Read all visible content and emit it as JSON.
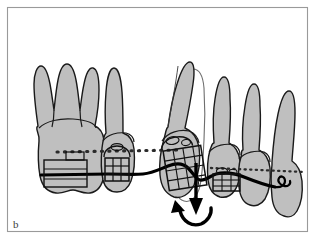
{
  "figure": {
    "panel_label": "b",
    "background_color": "#ffffff",
    "border_color": "#9a9a9a",
    "tooth_fill": "#bfbfbf",
    "tooth_outline": "#1a1a1a",
    "ghost_outline_color": "#6e6e6e",
    "ghost_fill": "#ffffff",
    "archwire_color": "#000000",
    "occlusal_line_color": "#2b2b2b",
    "arrow_color": "#000000",
    "bracket_color": "#111111"
  },
  "teeth": [
    {
      "id": "molar-left",
      "name": "Molar (anchor)",
      "state": "upright",
      "appliance": "molar-tube",
      "crown_center": {
        "x": 70,
        "y": 163
      },
      "roots": 3
    },
    {
      "id": "premolar-left",
      "name": "Second premolar",
      "state": "upright",
      "appliance": "bracket",
      "crown_center": {
        "x": 118,
        "y": 160
      },
      "roots": 1
    },
    {
      "id": "tipped-tooth",
      "name": "Mesially tipped molar / canine",
      "state": "tipped",
      "appliance": "bracket",
      "crown_center": {
        "x": 196,
        "y": 160
      },
      "roots": 1,
      "has_ghost_target": true
    },
    {
      "id": "premolar-right",
      "name": "Premolar",
      "state": "upright",
      "appliance": "bracket",
      "crown_center": {
        "x": 240,
        "y": 168
      },
      "roots": 1
    },
    {
      "id": "canine-right",
      "name": "Canine",
      "state": "upright",
      "appliance": "none",
      "crown_center": {
        "x": 272,
        "y": 175
      },
      "roots": 1
    }
  ],
  "appliances": {
    "archwire": {
      "label": "Sectional archwire",
      "style": "solid-thick",
      "has_step_bend": true,
      "has_distal_hook": true
    },
    "occlusal_plane": {
      "label": "Occlusal reference line",
      "style": "dotted"
    },
    "brackets": [
      {
        "id": "molar-tube",
        "type": "tube",
        "tooth": "molar-left"
      },
      {
        "id": "bracket-premolar-left",
        "type": "twin-bracket",
        "tooth": "premolar-left"
      },
      {
        "id": "bracket-tipped",
        "type": "multi-cell-bracket",
        "tooth": "tipped-tooth"
      },
      {
        "id": "bracket-premolar-right",
        "type": "twin-bracket",
        "tooth": "premolar-right"
      }
    ]
  },
  "force_indicators": [
    {
      "id": "extrusion-arrow",
      "type": "straight-arrow",
      "direction": "down",
      "label": "Vertical (extrusive) force on tipped tooth"
    },
    {
      "id": "uprighting-arrow",
      "type": "curved-arrow",
      "direction": "counter-clockwise",
      "label": "Uprighting / rotational moment"
    },
    {
      "id": "distal-hook",
      "type": "wire-curl",
      "direction": "distal",
      "label": "Distal end curl of archwire"
    }
  ]
}
